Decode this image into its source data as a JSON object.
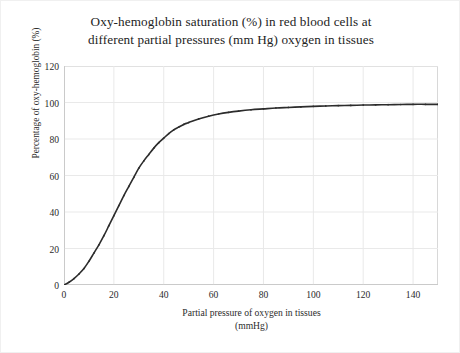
{
  "chart_data": {
    "type": "line",
    "title": "Oxy-hemoglobin saturation (%) in red blood cells at different partial pressures (mm Hg) oxygen in tissues",
    "title_lines": [
      "Oxy-hemoglobin saturation (%) in red blood cells at",
      "different partial pressures (mm Hg) oxygen in tissues"
    ],
    "xlabel": "Partial pressure of oxygen in tissues (mmHg)",
    "xlabel_lines": [
      "Partial pressure of oxygen in tissues",
      "(mmHg)"
    ],
    "ylabel": "Percentage of oxy-hemoglobin (%)",
    "xlim": [
      0,
      150
    ],
    "ylim": [
      0,
      120
    ],
    "xticks": [
      0,
      20,
      40,
      60,
      80,
      100,
      120,
      140
    ],
    "yticks": [
      0,
      20,
      40,
      60,
      80,
      100,
      120
    ],
    "grid": true,
    "legend": null,
    "series": [
      {
        "name": "Oxy-hemoglobin saturation",
        "color": "#2c2c2c",
        "x": [
          0,
          2,
          4,
          6,
          8,
          10,
          12,
          14,
          16,
          18,
          20,
          22,
          24,
          26,
          28,
          30,
          32,
          34,
          36,
          38,
          40,
          42,
          44,
          46,
          48,
          50,
          54,
          58,
          62,
          66,
          70,
          75,
          80,
          85,
          90,
          95,
          100,
          105,
          110,
          115,
          120,
          125,
          130,
          135,
          140,
          145,
          150
        ],
        "values": [
          0,
          1.5,
          3.5,
          6,
          9,
          13,
          17.5,
          22,
          27,
          32.5,
          38,
          43.5,
          49,
          54,
          59,
          64,
          68,
          71.5,
          75,
          78,
          80.5,
          83,
          85,
          86.5,
          88,
          89,
          91,
          92.5,
          93.7,
          94.6,
          95.3,
          96,
          96.5,
          97,
          97.3,
          97.6,
          97.9,
          98.1,
          98.3,
          98.4,
          98.6,
          98.7,
          98.8,
          98.9,
          99,
          99,
          99
        ]
      }
    ]
  },
  "axis": {
    "ytick_labels": [
      "120",
      "100",
      "80",
      "60",
      "40",
      "20",
      "0"
    ],
    "xtick_labels": [
      "0",
      "20",
      "40",
      "60",
      "80",
      "100",
      "120",
      "140"
    ]
  }
}
